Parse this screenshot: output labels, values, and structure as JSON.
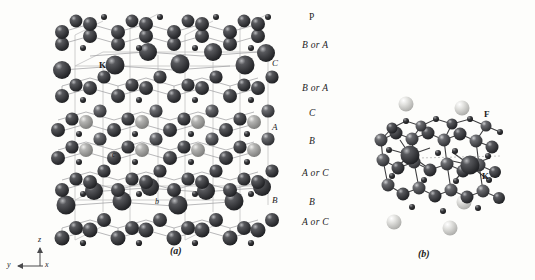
{
  "figure": {
    "background_color": "#fdfdfb",
    "panels": [
      {
        "id": "a",
        "label": "(a)",
        "x": 175,
        "y": 252
      },
      {
        "id": "b",
        "label": "(b)",
        "x": 423,
        "y": 255
      }
    ]
  },
  "panel_a": {
    "stacking_labels": [
      {
        "text": "P",
        "x": 309,
        "y": 18
      },
      {
        "text": "B or A",
        "x": 302,
        "y": 46
      },
      {
        "text": "B or A",
        "x": 302,
        "y": 89
      },
      {
        "text": "C",
        "x": 309,
        "y": 114
      },
      {
        "text": "B",
        "x": 309,
        "y": 142
      },
      {
        "text": "A or C",
        "x": 302,
        "y": 174
      },
      {
        "text": "B",
        "x": 309,
        "y": 203
      },
      {
        "text": "A or C",
        "x": 302,
        "y": 223
      }
    ],
    "inner_labels": [
      {
        "text": "C",
        "x": 272,
        "y": 64
      },
      {
        "text": "A",
        "x": 272,
        "y": 128
      },
      {
        "text": "B",
        "x": 272,
        "y": 201
      }
    ],
    "atom_labels": [
      {
        "text": "K",
        "x": 101,
        "y": 66
      },
      {
        "text": "c",
        "x": 113,
        "y": 156
      },
      {
        "text": "b",
        "x": 156,
        "y": 203
      }
    ],
    "axes": {
      "z_label": "z",
      "y_label": "y",
      "x_label": "x",
      "origin_x": 40,
      "origin_y": 268
    },
    "colors": {
      "dark_atom": "#2f3033",
      "mid_atom": "#4a4b4f",
      "light_atom": "#9a9a9c",
      "small_atom": "#1b1b1d",
      "bond": "#8e8e90",
      "cell_edge": "#b9b9ba"
    }
  },
  "panel_b": {
    "atom_labels": [
      {
        "text": "F",
        "x": 487,
        "y": 116
      },
      {
        "text": "K",
        "x": 485,
        "y": 178
      },
      {
        "text": "-",
        "x": 497,
        "y": 181
      }
    ],
    "colors": {
      "dark_atom": "#2b2c2f",
      "mid_atom": "#46474b",
      "pale_atom": "#d8d8d6",
      "bond": "#3a3a3c"
    }
  }
}
